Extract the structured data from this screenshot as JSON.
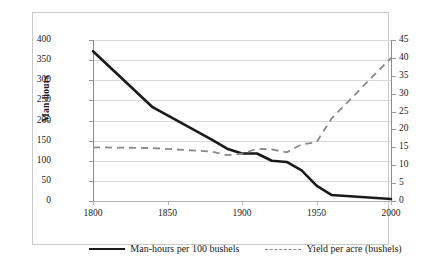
{
  "chart_data": {
    "type": "line",
    "title": "",
    "xlabel": "",
    "xlim": [
      1800,
      2000
    ],
    "x_ticks": [
      1800,
      1850,
      1900,
      1950,
      2000
    ],
    "grid": true,
    "legend_position": "bottom",
    "axes": {
      "left": {
        "label": "Man-hours",
        "ylim": [
          0,
          400
        ],
        "ticks": [
          0,
          50,
          100,
          150,
          200,
          250,
          300,
          350,
          400
        ]
      },
      "right": {
        "label": "Yield per acre (bushels)",
        "ylim": [
          0,
          45
        ],
        "ticks": [
          0,
          5,
          10,
          15,
          20,
          25,
          30,
          35,
          40,
          45
        ]
      }
    },
    "series": [
      {
        "name": "Man-hours per 100 bushels",
        "axis": "left",
        "style": "solid",
        "color": "#1a1a1a",
        "x": [
          1800,
          1840,
          1880,
          1890,
          1900,
          1910,
          1920,
          1930,
          1940,
          1950,
          1960,
          1980,
          2000
        ],
        "values": [
          372,
          233,
          152,
          130,
          118,
          118,
          100,
          97,
          76,
          38,
          15,
          10,
          5
        ]
      },
      {
        "name": "Yield per acre (bushels)",
        "axis": "right",
        "style": "dashed",
        "color": "#8a8a8a",
        "x": [
          1800,
          1840,
          1880,
          1890,
          1900,
          1910,
          1920,
          1930,
          1940,
          1950,
          1960,
          1980,
          2000
        ],
        "values": [
          15.0,
          14.8,
          13.8,
          12.8,
          13.2,
          14.6,
          14.4,
          13.6,
          15.8,
          16.4,
          23.0,
          31.5,
          40.0
        ]
      }
    ]
  },
  "legend": {
    "items": [
      {
        "label": "Man-hours per 100 bushels",
        "style": "solid"
      },
      {
        "label": "Yield per acre (bushels)",
        "style": "dashed"
      }
    ]
  },
  "axis_titles": {
    "left": "Man-hours",
    "right": "Yield per acre (bushels)"
  },
  "tick_labels": {
    "left": [
      "400",
      "350",
      "300",
      "250",
      "200",
      "150",
      "100",
      "50",
      "0"
    ],
    "right": [
      "45",
      "40",
      "35",
      "30",
      "25",
      "20",
      "15",
      "10",
      "5",
      "0"
    ],
    "bottom": [
      "1800",
      "1850",
      "1900",
      "1950",
      "2000"
    ]
  }
}
